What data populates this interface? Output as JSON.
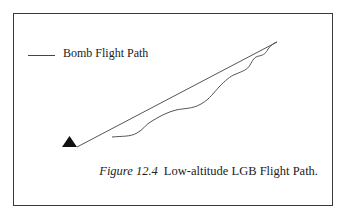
{
  "figure": {
    "number": "Figure 12.4",
    "title": "Low-altitude LGB Flight Path."
  },
  "legend": {
    "items": [
      {
        "label": "Bomb Flight Path",
        "color": "#444444"
      }
    ]
  },
  "diagram": {
    "launch_marker": "triangle",
    "elements": [
      {
        "name": "line-of-sight",
        "type": "straight-line",
        "from": [
          77,
          147
        ],
        "to": [
          277,
          42
        ]
      },
      {
        "name": "bomb-flight-path",
        "type": "curve",
        "from": [
          112,
          137
        ],
        "to": [
          277,
          42
        ]
      }
    ]
  }
}
